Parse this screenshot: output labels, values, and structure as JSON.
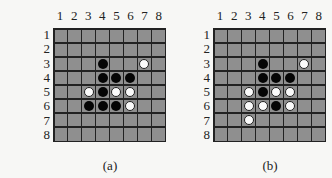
{
  "figure": {
    "boards": [
      {
        "id": "a",
        "caption": "(a)",
        "col_labels": [
          "1",
          "2",
          "3",
          "4",
          "5",
          "6",
          "7",
          "8"
        ],
        "row_labels": [
          "1",
          "2",
          "3",
          "4",
          "5",
          "6",
          "7",
          "8"
        ],
        "pieces": [
          {
            "row": 3,
            "col": 4,
            "color": "black"
          },
          {
            "row": 3,
            "col": 7,
            "color": "white"
          },
          {
            "row": 4,
            "col": 4,
            "color": "black"
          },
          {
            "row": 4,
            "col": 5,
            "color": "black"
          },
          {
            "row": 4,
            "col": 6,
            "color": "black"
          },
          {
            "row": 5,
            "col": 3,
            "color": "white"
          },
          {
            "row": 5,
            "col": 4,
            "color": "black"
          },
          {
            "row": 5,
            "col": 5,
            "color": "white"
          },
          {
            "row": 5,
            "col": 6,
            "color": "white"
          },
          {
            "row": 6,
            "col": 3,
            "color": "black"
          },
          {
            "row": 6,
            "col": 4,
            "color": "black"
          },
          {
            "row": 6,
            "col": 5,
            "color": "black"
          },
          {
            "row": 6,
            "col": 6,
            "color": "white"
          }
        ]
      },
      {
        "id": "b",
        "caption": "(b)",
        "col_labels": [
          "1",
          "2",
          "3",
          "4",
          "5",
          "6",
          "7",
          "8"
        ],
        "row_labels": [
          "1",
          "2",
          "3",
          "4",
          "5",
          "6",
          "7",
          "8"
        ],
        "pieces": [
          {
            "row": 3,
            "col": 4,
            "color": "black"
          },
          {
            "row": 3,
            "col": 7,
            "color": "white"
          },
          {
            "row": 4,
            "col": 4,
            "color": "black"
          },
          {
            "row": 4,
            "col": 5,
            "color": "black"
          },
          {
            "row": 4,
            "col": 6,
            "color": "black"
          },
          {
            "row": 5,
            "col": 3,
            "color": "white"
          },
          {
            "row": 5,
            "col": 4,
            "color": "black"
          },
          {
            "row": 5,
            "col": 5,
            "color": "white"
          },
          {
            "row": 5,
            "col": 6,
            "color": "white"
          },
          {
            "row": 6,
            "col": 3,
            "color": "white"
          },
          {
            "row": 6,
            "col": 4,
            "color": "white"
          },
          {
            "row": 6,
            "col": 5,
            "color": "black"
          },
          {
            "row": 6,
            "col": 6,
            "color": "white"
          },
          {
            "row": 7,
            "col": 3,
            "color": "white"
          }
        ]
      }
    ],
    "colors": {
      "cell": "#8f8f8f",
      "grid_line": "#222222",
      "black_piece": "#050505",
      "white_piece": "#fafafa"
    }
  }
}
